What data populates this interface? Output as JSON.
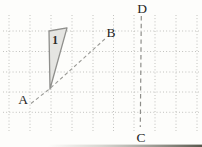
{
  "figure": {
    "type": "geometry-diagram",
    "background": "#fdfdfb",
    "width": 202,
    "height": 147,
    "grid": {
      "color": "#b3b3b0",
      "vertical_x": [
        9,
        30,
        51,
        72,
        93,
        113.5,
        134,
        155,
        176,
        197
      ],
      "v_y1": 15,
      "v_y2": 131,
      "horizontal_y": [
        31,
        51.5,
        72,
        92,
        112.3
      ],
      "h_x1": 3,
      "h_x2": 199
    },
    "triangle": {
      "label": "1",
      "points": "49,31 67,27.8 50,89",
      "fill": "#e5e5e2",
      "stroke": "#8f8f8c",
      "label_x": 55,
      "label_y": 44,
      "label_color": "#2b2b28"
    },
    "line_ab": {
      "points": "31,103.5 50,88.5 106,38",
      "color": "#9a9a96"
    },
    "line_cd": {
      "x1": 141.3,
      "y1": 16,
      "x2": 140.3,
      "y2": 127,
      "color": "#8d8d89"
    },
    "labels": [
      {
        "id": "A",
        "text": "A",
        "x": 23,
        "y": 104
      },
      {
        "id": "B",
        "text": "B",
        "x": 111,
        "y": 37
      },
      {
        "id": "D",
        "text": "D",
        "x": 142,
        "y": 13
      },
      {
        "id": "C",
        "text": "C",
        "x": 141,
        "y": 142
      }
    ],
    "label_color": "#262624",
    "scan_artifact": {
      "x": 48,
      "y": 144.6,
      "width": 154,
      "height": 2.4,
      "color_start": "#c9c9c2",
      "color_end": "#57574c"
    }
  }
}
